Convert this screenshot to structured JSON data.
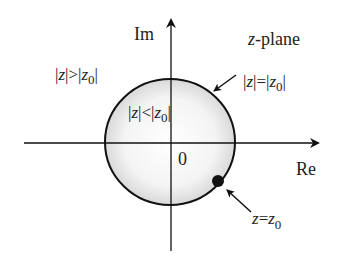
{
  "diagram": {
    "title": "z-plane",
    "title_italic_part": "z",
    "title_rest": "-plane",
    "axes": {
      "x_label": "Re",
      "y_label": "Im",
      "origin_label": "0"
    },
    "regions": {
      "outside": {
        "label_parts": [
          "|",
          "z",
          "|>|",
          "z",
          "0",
          "|"
        ],
        "text": "|z|>|z0|"
      },
      "inside": {
        "label_parts": [
          "|",
          "z",
          "|<|",
          "z",
          "0",
          "|"
        ],
        "text": "|z|<|z0|"
      },
      "boundary": {
        "label_parts": [
          "|",
          "z",
          "|=|",
          "z",
          "0",
          "|"
        ],
        "text": "|z|=|z0|"
      }
    },
    "point": {
      "label_parts": [
        "z",
        "=",
        "z",
        "0"
      ],
      "text": "z=z0"
    },
    "colors": {
      "stroke": "#111111",
      "fill_center": "#ffffff",
      "fill_edge": "#d9d9d9"
    }
  }
}
